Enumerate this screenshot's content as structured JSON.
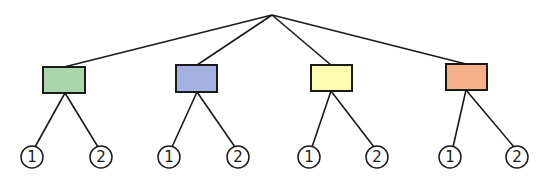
{
  "diagram": {
    "type": "tree",
    "root": {
      "x": 272,
      "y": 15
    },
    "branches": [
      {
        "name": "green",
        "color": "#a9d5a8",
        "box": {
          "x": 43,
          "y": 67,
          "w": 42,
          "h": 26
        },
        "leaves": [
          {
            "label": "1",
            "cx": 32,
            "cy": 157
          },
          {
            "label": "2",
            "cx": 101,
            "cy": 157
          }
        ]
      },
      {
        "name": "blue",
        "color": "#a5b1e0",
        "box": {
          "x": 176,
          "y": 65,
          "w": 41,
          "h": 27
        },
        "leaves": [
          {
            "label": "1",
            "cx": 169,
            "cy": 157
          },
          {
            "label": "2",
            "cx": 238,
            "cy": 157
          }
        ]
      },
      {
        "name": "yellow",
        "color": "#fdfbb0",
        "box": {
          "x": 311,
          "y": 65,
          "w": 41,
          "h": 26
        },
        "leaves": [
          {
            "label": "1",
            "cx": 309,
            "cy": 157
          },
          {
            "label": "2",
            "cx": 377,
            "cy": 157
          }
        ]
      },
      {
        "name": "orange",
        "color": "#f7b08c",
        "box": {
          "x": 446,
          "y": 64,
          "w": 41,
          "h": 26
        },
        "leaves": [
          {
            "label": "1",
            "cx": 450,
            "cy": 157
          },
          {
            "label": "2",
            "cx": 517,
            "cy": 157
          }
        ]
      }
    ],
    "leaf_radius": 11,
    "labels": {
      "b0_l0": "1",
      "b0_l1": "2",
      "b1_l0": "1",
      "b1_l1": "2",
      "b2_l0": "1",
      "b2_l1": "2",
      "b3_l0": "1",
      "b3_l1": "2"
    }
  }
}
